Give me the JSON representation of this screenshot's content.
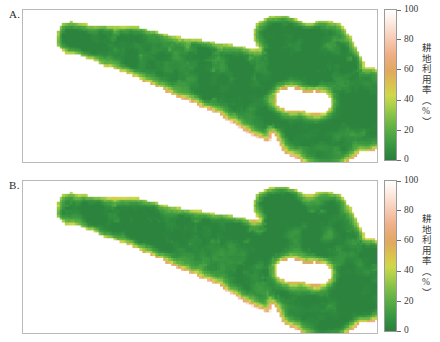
{
  "figure": {
    "background": "#ffffff",
    "panels": [
      {
        "id": "A",
        "label": "A.",
        "colorbar": {
          "title": "耕地利用率（%）",
          "ticks": [
            "100",
            "80",
            "60",
            "40",
            "20",
            "0"
          ],
          "tick_values": [
            100,
            80,
            60,
            40,
            20,
            0
          ],
          "vmin": 0,
          "vmax": 100
        }
      },
      {
        "id": "B",
        "label": "B.",
        "colorbar": {
          "title": "耕地利用率（%）",
          "ticks": [
            "100",
            "80",
            "60",
            "40",
            "20",
            "0"
          ],
          "tick_values": [
            100,
            80,
            60,
            40,
            20,
            0
          ],
          "vmin": 0,
          "vmax": 100
        }
      }
    ]
  },
  "chart_data": {
    "type": "heatmap",
    "title": "",
    "subtitle": "",
    "xlabel": "",
    "ylabel": "",
    "grid": false,
    "legend_position": "right",
    "colorbar_label": "耕地利用率（%）",
    "colorbar_ticks": [
      0,
      20,
      40,
      60,
      80,
      100
    ],
    "zlim": [
      0,
      100
    ],
    "colormap_name": "white-pink-orange-yellow-green",
    "colormap_stops": [
      {
        "value": 100,
        "color": "#ffffff"
      },
      {
        "value": 93,
        "color": "#fdeee6"
      },
      {
        "value": 82,
        "color": "#f7cfb9"
      },
      {
        "value": 70,
        "color": "#efae85"
      },
      {
        "value": 59,
        "color": "#e0a95f"
      },
      {
        "value": 50,
        "color": "#d9c44f"
      },
      {
        "value": 43,
        "color": "#cfd84a"
      },
      {
        "value": 36,
        "color": "#a8cf4a"
      },
      {
        "value": 28,
        "color": "#7dbe46"
      },
      {
        "value": 20,
        "color": "#5aae44"
      },
      {
        "value": 12,
        "color": "#3f9c42"
      },
      {
        "value": 5,
        "color": "#2f8b3f"
      },
      {
        "value": 0,
        "color": "#2b7f3c"
      }
    ],
    "panels": [
      {
        "name": "A",
        "description": "Raster map of cultivated land utilization rate; elongated west-to-east region with a northern lobe in the east.",
        "value_range_observed": [
          5,
          100
        ],
        "dominant_value": 20
      },
      {
        "name": "B",
        "description": "Raster map of cultivated land utilization rate; same spatial extent as panel A with slightly different interior pattern.",
        "value_range_observed": [
          5,
          100
        ],
        "dominant_value": 20
      }
    ]
  }
}
